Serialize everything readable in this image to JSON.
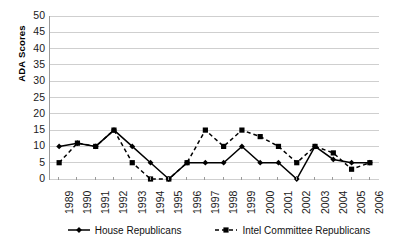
{
  "chart_data": {
    "type": "line",
    "title": "",
    "xlabel": "",
    "ylabel": "ADA Scores",
    "ylim": [
      0,
      50
    ],
    "ytick_step": 5,
    "grid": true,
    "legend_position": "bottom",
    "categories": [
      "1989",
      "1990",
      "1991",
      "1992",
      "1993",
      "1994",
      "1995",
      "1996",
      "1997",
      "1998",
      "1999",
      "2000",
      "2001",
      "2002",
      "2003",
      "2004",
      "2005",
      "2006"
    ],
    "yticks": [
      "0",
      "5",
      "10",
      "15",
      "20",
      "25",
      "30",
      "35",
      "40",
      "45",
      "50"
    ],
    "series": [
      {
        "name": "House Republicans",
        "marker": "diamond",
        "line_style": "solid",
        "color": "#000000",
        "values": [
          10,
          11,
          10,
          15,
          10,
          5,
          0,
          5,
          5,
          5,
          10,
          5,
          5,
          0,
          10,
          6,
          5,
          5
        ]
      },
      {
        "name": "Intel Committee Republicans",
        "marker": "square",
        "line_style": "dashed",
        "color": "#000000",
        "values": [
          5,
          11,
          10,
          15,
          5,
          0,
          0,
          5,
          15,
          10,
          15,
          13,
          10,
          5,
          10,
          8,
          3,
          5
        ]
      }
    ]
  },
  "axis": {
    "y_title": "ADA Scores"
  }
}
